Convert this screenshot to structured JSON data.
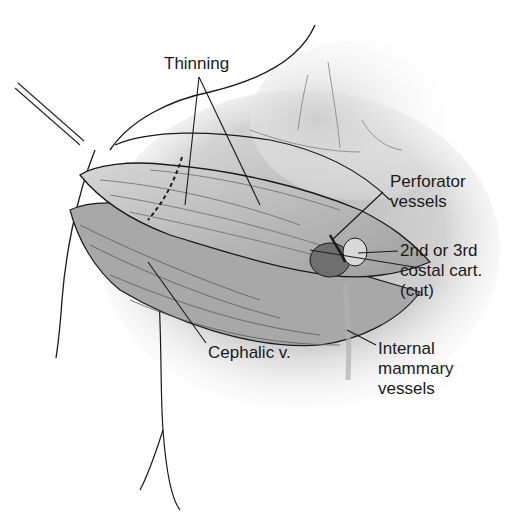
{
  "figure": {
    "type": "anatomical-illustration",
    "labels": {
      "thinning": "Thinning",
      "perforator_line1": "Perforator",
      "perforator_line2": "vessels",
      "costal_line1": "2nd or 3rd",
      "costal_line2": "costal cart.",
      "costal_line3": "(cut)",
      "cephalic": "Cephalic v.",
      "internal_line1": "Internal",
      "internal_line2": "mammary",
      "internal_line3": "vessels"
    },
    "colors": {
      "ink": "#1a1a1a",
      "skin_light": "#e4e4e4",
      "skin_mid": "#c8c8c8",
      "skin_dark": "#9a9a9a",
      "flap": "#bdbdbd"
    }
  }
}
